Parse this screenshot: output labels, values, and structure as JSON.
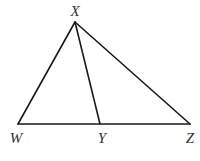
{
  "diagram": {
    "type": "triangle-with-cevian",
    "vertices": {
      "X": {
        "label": "X",
        "x": 75,
        "y": 22,
        "label_x": 75,
        "label_y": 16
      },
      "W": {
        "label": "W",
        "x": 18,
        "y": 124,
        "label_x": 16,
        "label_y": 143
      },
      "Y": {
        "label": "Y",
        "x": 100,
        "y": 124,
        "label_x": 102,
        "label_y": 143
      },
      "Z": {
        "label": "Z",
        "x": 190,
        "y": 124,
        "label_x": 190,
        "label_y": 143
      }
    },
    "segments": [
      {
        "from": "X",
        "to": "W",
        "name": "segment-xw"
      },
      {
        "from": "X",
        "to": "Z",
        "name": "segment-xz"
      },
      {
        "from": "W",
        "to": "Z",
        "name": "segment-wz"
      },
      {
        "from": "X",
        "to": "Y",
        "name": "segment-xy"
      }
    ],
    "stroke_color": "#1a1a1a",
    "label_color": "#333333",
    "background": "#ffffff"
  }
}
